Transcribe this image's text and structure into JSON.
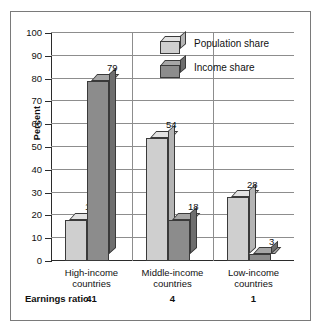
{
  "chart_data": {
    "type": "bar",
    "title": "",
    "xlabel": "",
    "ylabel": "Percent",
    "ylim": [
      0,
      100
    ],
    "ytick_labels": [
      "100",
      "90",
      "80",
      "70",
      "60",
      "50",
      "40",
      "30",
      "20",
      "10",
      "0"
    ],
    "ytick_values": [
      100,
      90,
      80,
      70,
      60,
      50,
      40,
      30,
      20,
      10,
      0
    ],
    "grid": true,
    "legend_position": "top-center",
    "categories": [
      "High-income countries",
      "Middle-income countries",
      "Low-income countries"
    ],
    "category_lines": [
      [
        "High-income",
        "countries"
      ],
      [
        "Middle-income",
        "countries"
      ],
      [
        "Low-income",
        "countries"
      ]
    ],
    "series": [
      {
        "name": "Population share",
        "color": "#cfcfcf",
        "values": [
          18,
          54,
          28
        ]
      },
      {
        "name": "Income share",
        "color": "#8c8c8c",
        "values": [
          79,
          18,
          3
        ]
      }
    ],
    "annotations": {
      "row_label": "Earnings ratio",
      "row_values": [
        "41",
        "4",
        "1"
      ]
    }
  },
  "legend": {
    "items": [
      {
        "label": "Population share",
        "icon": "cube-light-icon"
      },
      {
        "label": "Income share",
        "icon": "cube-dark-icon"
      }
    ]
  },
  "colors": {
    "light_face": "#cfcfcf",
    "light_top": "#e2e2e2",
    "light_side": "#b4b4b4",
    "dark_face": "#8c8c8c",
    "dark_top": "#a6a6a6",
    "dark_side": "#6e6e6e",
    "grid": "#8d8d8d",
    "axis": "#2b2b2b",
    "frame": "#7a7a7a",
    "background": "#ffffff"
  }
}
